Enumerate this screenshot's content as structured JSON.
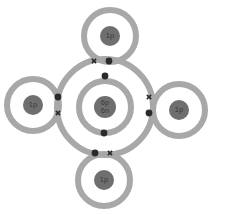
{
  "diagram": {
    "type": "dot-and-cross",
    "canvas": {
      "width": 235,
      "height": 214,
      "background": "#ffffff"
    },
    "colors": {
      "shell": "#a8a8a8",
      "nucleus": "#6f6f6f",
      "nucleus_text": "#3a3a3a",
      "dot": "#2b2b2b",
      "cross": "#2b2b2b",
      "background": "#ffffff"
    },
    "atoms": [
      {
        "id": "carbon-center",
        "element_label_line1": "6p",
        "element_label_line2": "6n",
        "cx": 105,
        "cy": 107,
        "nucleus_r": 11,
        "shells": [
          26,
          48
        ],
        "shell_width": 6
      },
      {
        "id": "hydrogen-top",
        "element_label_line1": "1p",
        "element_label_line2": "",
        "cx": 110,
        "cy": 36,
        "nucleus_r": 10,
        "shells": [
          26
        ],
        "shell_width": 6
      },
      {
        "id": "hydrogen-left",
        "element_label_line1": "1p",
        "element_label_line2": "",
        "cx": 33,
        "cy": 105,
        "nucleus_r": 10,
        "shells": [
          26
        ],
        "shell_width": 6
      },
      {
        "id": "hydrogen-right",
        "element_label_line1": "1p",
        "element_label_line2": "",
        "cx": 179,
        "cy": 110,
        "nucleus_r": 10,
        "shells": [
          26
        ],
        "shell_width": 6
      },
      {
        "id": "hydrogen-bottom",
        "element_label_line1": "1p",
        "element_label_line2": "",
        "cx": 104,
        "cy": 180,
        "nucleus_r": 10,
        "shells": [
          26
        ],
        "shell_width": 6
      }
    ],
    "inner_shell_electrons": [
      {
        "id": "carbon-inner-electron-top",
        "symbol": "dot",
        "x": 105,
        "y": 76
      },
      {
        "id": "carbon-inner-electron-bottom",
        "symbol": "dot",
        "x": 104,
        "y": 133
      }
    ],
    "bonding_pairs": [
      {
        "id": "bond-carbon-hydrogen-top",
        "electrons": [
          {
            "symbol": "cross",
            "x": 94,
            "y": 61
          },
          {
            "symbol": "dot",
            "x": 109,
            "y": 61
          }
        ]
      },
      {
        "id": "bond-carbon-hydrogen-left",
        "electrons": [
          {
            "symbol": "dot",
            "x": 58,
            "y": 97
          },
          {
            "symbol": "cross",
            "x": 58,
            "y": 113
          }
        ]
      },
      {
        "id": "bond-carbon-hydrogen-right",
        "electrons": [
          {
            "symbol": "cross",
            "x": 149,
            "y": 97
          },
          {
            "symbol": "dot",
            "x": 149,
            "y": 113
          }
        ]
      },
      {
        "id": "bond-carbon-hydrogen-bottom",
        "electrons": [
          {
            "symbol": "dot",
            "x": 95,
            "y": 153
          },
          {
            "symbol": "cross",
            "x": 110,
            "y": 153
          }
        ]
      }
    ],
    "dot_radius": 3.4,
    "cross_size": 4.2,
    "cross_stroke": 1.6,
    "label_font_size": 7.5,
    "label_line_gap": 8
  }
}
